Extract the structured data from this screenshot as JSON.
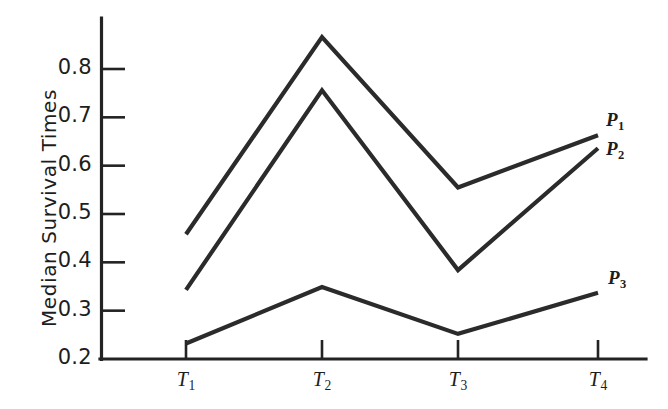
{
  "chart_data": {
    "type": "line",
    "title": "",
    "subtitle": "",
    "xlabel": "",
    "ylabel": "Median Survival Times",
    "categories": [
      "T1",
      "T2",
      "T3",
      "T4"
    ],
    "category_labels": [
      "T",
      "T",
      "T",
      "T"
    ],
    "category_subscripts": [
      "1",
      "2",
      "3",
      "4"
    ],
    "ytick_labels": [
      "0.8",
      "0.7",
      "0.6",
      "0.5",
      "0.4",
      "0.3",
      "0.2"
    ],
    "ytick_values": [
      0.8,
      0.7,
      0.6,
      0.5,
      0.4,
      0.3,
      0.2
    ],
    "ylim": [
      0.2,
      0.88
    ],
    "xlim": [
      0,
      5
    ],
    "grid": false,
    "legend_position": "right-end-of-line",
    "series": [
      {
        "name": "P1",
        "label_base": "P",
        "label_sub": "1",
        "values": [
          0.458,
          0.866,
          0.555,
          0.663
        ]
      },
      {
        "name": "P2",
        "label_base": "P",
        "label_sub": "2",
        "values": [
          0.343,
          0.756,
          0.384,
          0.636
        ]
      },
      {
        "name": "P3",
        "label_base": "P",
        "label_sub": "3",
        "values": [
          0.232,
          0.349,
          0.252,
          0.337
        ]
      }
    ],
    "colors": {
      "line": "#2b2b2b",
      "axis": "#232323",
      "text": "#1d1d1d",
      "background": "#ffffff"
    }
  }
}
